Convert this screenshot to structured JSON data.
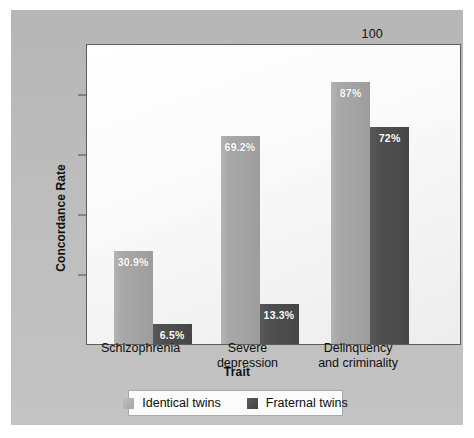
{
  "chart_data": {
    "type": "bar",
    "title": "",
    "subtitle": "",
    "xlabel": "Trait",
    "ylabel": "Concordance Rate",
    "ylim": [
      0,
      100
    ],
    "yticks": [
      0,
      20,
      40,
      60,
      80,
      100
    ],
    "grid": false,
    "legend_position": "bottom",
    "categories": [
      "Schizophrenia",
      "Severe\ndepression",
      "Delinquency\nand criminality"
    ],
    "series": [
      {
        "name": "Identical twins",
        "color": "#a5a5a5",
        "values": [
          30.9,
          69.2,
          87
        ],
        "labels": [
          "30.9%",
          "69.2%",
          "87%"
        ]
      },
      {
        "name": "Fraternal twins",
        "color": "#4b4b4b",
        "values": [
          6.5,
          13.3,
          72
        ],
        "labels": [
          "6.5%",
          "13.3%",
          "72%"
        ]
      }
    ]
  },
  "axis": {
    "y_title": "Concordance Rate",
    "x_title": "Trait",
    "tick_labels": [
      "0",
      "20",
      "40",
      "60",
      "80",
      "100"
    ]
  },
  "legend": {
    "items": [
      {
        "label": "Identical twins",
        "swatch": "light"
      },
      {
        "label": "Fraternal twins",
        "swatch": "dark"
      }
    ]
  },
  "colors": {
    "panel_background": "#bdbdbd",
    "plot_background": "#f7f7f7",
    "axis_line": "#5d5d5d",
    "identical_twins": "#a5a5a5",
    "fraternal_twins": "#4b4b4b",
    "value_label_text": "#ffffff"
  }
}
